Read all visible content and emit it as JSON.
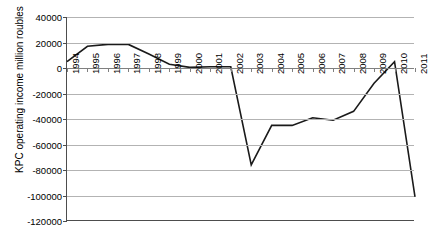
{
  "chart_data": {
    "type": "line",
    "title": "",
    "xlabel": "",
    "ylabel": "KPC operating income million roubles",
    "categories": [
      "1994",
      "1995",
      "1996",
      "1997",
      "1998",
      "1999",
      "2000",
      "2001",
      "2002",
      "2003",
      "2004",
      "2005",
      "2006",
      "2007",
      "2008",
      "2009",
      "2010",
      "2011"
    ],
    "values": [
      5000,
      17000,
      18500,
      18500,
      11000,
      3000,
      500,
      1000,
      1000,
      -76000,
      -45000,
      -45000,
      -39000,
      -41000,
      -34000,
      -12000,
      5000,
      -101000
    ],
    "series": [
      {
        "name": "KPC operating income",
        "values": [
          5000,
          17000,
          18500,
          18500,
          11000,
          3000,
          500,
          1000,
          1000,
          -76000,
          -45000,
          -45000,
          -39000,
          -41000,
          -34000,
          -12000,
          5000,
          -101000
        ]
      }
    ],
    "ylim": [
      -120000,
      40000
    ],
    "ytick_values": [
      40000,
      20000,
      0,
      -20000,
      -40000,
      -60000,
      -80000,
      -100000,
      -120000
    ],
    "ytick_labels": [
      "40000",
      "20000",
      "0",
      "-20000",
      "-40000",
      "-60000",
      "-80000",
      "-100000",
      "-120000"
    ],
    "grid": true,
    "legend": "none",
    "line_color": "#1a1a1a",
    "grid_color": "#b3b3b3",
    "axis_color": "#4d4d4d",
    "background": "#ffffff"
  }
}
